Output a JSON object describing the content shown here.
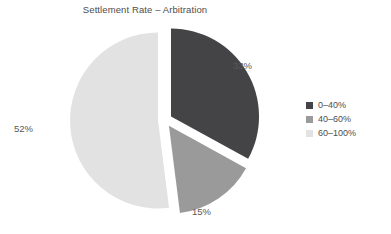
{
  "chart_data": {
    "type": "pie",
    "title": "Settlement Rate – Arbitration",
    "xlabel": "",
    "ylabel": "",
    "legend_position": "right",
    "grid": false,
    "exploded": true,
    "categories": [
      "0–40%",
      "40–60%",
      "60–100%"
    ],
    "values": [
      33,
      15,
      52
    ],
    "value_labels": [
      "33%",
      "15%",
      "52%"
    ],
    "colors": [
      "#444446",
      "#9a9a9a",
      "#e2e2e2"
    ],
    "slices": [
      {
        "label": "0–40%",
        "value": 33,
        "value_label": "33%",
        "color": "#444446",
        "start_angle_deg": 0,
        "end_angle_deg": 118.8
      },
      {
        "label": "40–60%",
        "value": 15,
        "value_label": "15%",
        "color": "#9a9a9a",
        "start_angle_deg": 118.8,
        "end_angle_deg": 172.8
      },
      {
        "label": "60–100%",
        "value": 52,
        "value_label": "52%",
        "color": "#e2e2e2",
        "start_angle_deg": 172.8,
        "end_angle_deg": 360
      }
    ]
  },
  "legend": {
    "items": [
      {
        "label": "0–40%",
        "color": "#444446"
      },
      {
        "label": "40–60%",
        "color": "#9a9a9a"
      },
      {
        "label": "60–100%",
        "color": "#e2e2e2"
      }
    ]
  },
  "background_color": "#ffffff"
}
